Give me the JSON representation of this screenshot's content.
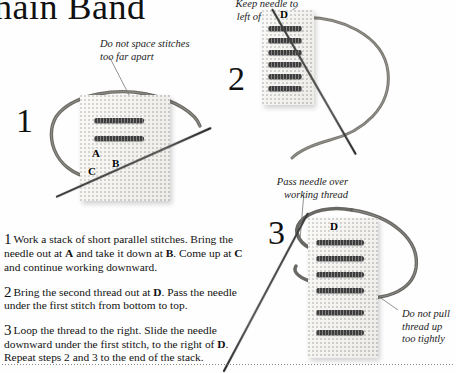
{
  "page": {
    "title": "hain Band",
    "background_color": "#fefefe",
    "ink_color": "#111111",
    "fabric_color": "#f7f6f2",
    "thread_color": "#555550"
  },
  "annotations": [
    {
      "id": "a1",
      "text": "Do not space stitches\ntoo far apart",
      "align": "left"
    },
    {
      "id": "a2",
      "text": "Keep needle to\nleft of working\nthread",
      "align": "right"
    },
    {
      "id": "a3",
      "text": "Pass needle over\nworking thread",
      "align": "right"
    },
    {
      "id": "a4",
      "text": "Do not pull\nthread up\ntoo tightly",
      "align": "left"
    }
  ],
  "diagrams": [
    {
      "numeral": "1",
      "labels": [
        {
          "text": "A"
        },
        {
          "text": "B"
        },
        {
          "text": "C"
        }
      ],
      "stitch_count": 2
    },
    {
      "numeral": "2",
      "labels": [
        {
          "text": "D"
        }
      ],
      "stitch_count": 6
    },
    {
      "numeral": "3",
      "labels": [
        {
          "text": "D"
        }
      ],
      "stitch_count": 6
    }
  ],
  "steps": [
    {
      "number": "1",
      "text_parts": [
        {
          "t": "Work a stack of short parallel stitches. Bring the needle out at "
        },
        {
          "t": "A",
          "bold": true
        },
        {
          "t": " and take it down at "
        },
        {
          "t": "B",
          "bold": true
        },
        {
          "t": ". Come up at "
        },
        {
          "t": "C",
          "bold": true
        },
        {
          "t": " and continue working downward."
        }
      ],
      "plain": "Work a stack of short parallel stitches. Bring the needle out at A and take it down at B. Come up at C and continue working downward."
    },
    {
      "number": "2",
      "text_parts": [
        {
          "t": "Bring the second thread out at "
        },
        {
          "t": "D",
          "bold": true
        },
        {
          "t": ". Pass the needle under the first stitch from bottom to top."
        }
      ],
      "plain": "Bring the second thread out at D. Pass the needle under the first stitch from bottom to top."
    },
    {
      "number": "3",
      "text_parts": [
        {
          "t": "Loop the thread to the right. Slide the needle downward under the first stitch, to the right of "
        },
        {
          "t": "D",
          "bold": true
        },
        {
          "t": ". Repeat steps 2 and 3 to the end of the stack."
        }
      ],
      "plain": "Loop the thread to the right. Slide the needle downward under the first stitch, to the right of D. Repeat steps 2 and 3 to the end of the stack."
    }
  ]
}
